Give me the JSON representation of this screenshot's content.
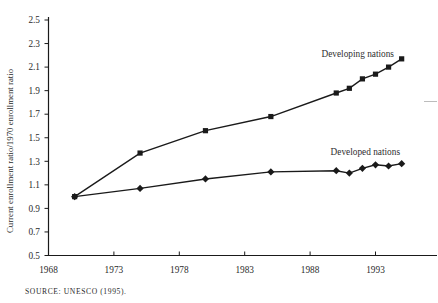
{
  "chart_data": {
    "type": "line",
    "title": "",
    "xlabel": "",
    "ylabel": "Current enrollment ratio/1970 enrollment ratio",
    "x": [
      1970,
      1975,
      1980,
      1985,
      1990,
      1991,
      1992,
      1993,
      1994,
      1995
    ],
    "series": [
      {
        "name": "Developing nations",
        "marker": "square",
        "values": [
          1.0,
          1.37,
          1.56,
          1.68,
          1.88,
          1.92,
          2.0,
          2.04,
          2.1,
          2.17
        ]
      },
      {
        "name": "Developed nations",
        "marker": "diamond",
        "values": [
          1.0,
          1.07,
          1.15,
          1.21,
          1.22,
          1.2,
          1.24,
          1.27,
          1.26,
          1.28
        ]
      }
    ],
    "x_ticks": [
      1968,
      1973,
      1978,
      1983,
      1988,
      1993
    ],
    "y_ticks": [
      2.5,
      2.3,
      2.1,
      1.9,
      1.7,
      1.5,
      1.3,
      1.1,
      0.9,
      0.7,
      0.5
    ],
    "xlim": [
      1968,
      1997.7
    ],
    "ylim": [
      0.5,
      2.5
    ],
    "grid": false,
    "legend_position": "inline-labels",
    "line_color": "#1a1a1a"
  },
  "source_note": "SOURCE: UNESCO (1995)."
}
